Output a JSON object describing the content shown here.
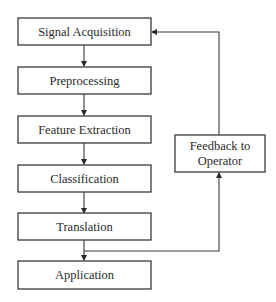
{
  "diagram": {
    "type": "flowchart",
    "nodes": [
      {
        "id": "signal_acquisition",
        "label": "Signal Acquisition"
      },
      {
        "id": "preprocessing",
        "label": "Preprocessing"
      },
      {
        "id": "feature_extraction",
        "label": "Feature Extraction"
      },
      {
        "id": "classification",
        "label": "Classification"
      },
      {
        "id": "translation",
        "label": "Translation"
      },
      {
        "id": "application",
        "label": "Application"
      },
      {
        "id": "feedback",
        "label_lines": [
          "Feedback to",
          "Operator"
        ]
      }
    ],
    "edges": [
      {
        "from": "signal_acquisition",
        "to": "preprocessing"
      },
      {
        "from": "preprocessing",
        "to": "feature_extraction"
      },
      {
        "from": "feature_extraction",
        "to": "classification"
      },
      {
        "from": "classification",
        "to": "translation"
      },
      {
        "from": "translation",
        "to": "application"
      },
      {
        "from": "translation",
        "to": "feedback"
      },
      {
        "from": "feedback",
        "to": "signal_acquisition"
      }
    ]
  }
}
